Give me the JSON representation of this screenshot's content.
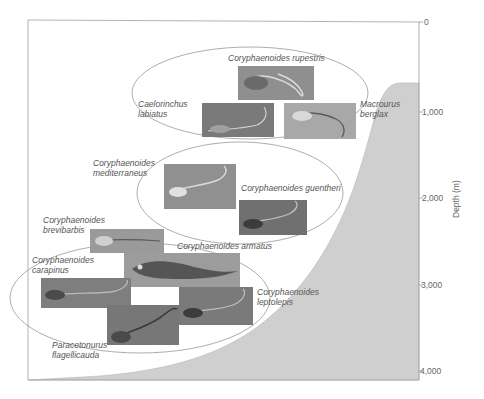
{
  "figure": {
    "axis": {
      "title": "Depth (m)",
      "ticks": [
        {
          "label": "0",
          "y": 22
        },
        {
          "label": "1,000",
          "y": 112
        },
        {
          "label": "2,000",
          "y": 198
        },
        {
          "label": "3,000",
          "y": 285
        },
        {
          "label": "4,000",
          "y": 371
        }
      ]
    },
    "colors": {
      "seafloor": "#cfcfcf",
      "frame": "#9a9a9a",
      "ellipse": "#8a8a8a",
      "label": "#555555",
      "photo_bg": "#8c8c8c"
    },
    "groups": [
      {
        "name": "shallow-group",
        "species": [
          {
            "line1": "Coryphaenoides rupestris",
            "line2": ""
          },
          {
            "line1": "Caelorinchus",
            "line2": "labiatus"
          },
          {
            "line1": "Macrourus",
            "line2": "berglax"
          }
        ]
      },
      {
        "name": "mid-group",
        "species": [
          {
            "line1": "Coryphaenoides",
            "line2": "mediterraneus"
          },
          {
            "line1": "Coryphaenoides guentheri",
            "line2": ""
          }
        ]
      },
      {
        "name": "deep-group",
        "species": [
          {
            "line1": "Coryphaenoides",
            "line2": "brevibarbis"
          },
          {
            "line1": "Coryphaenoides armatus",
            "line2": ""
          },
          {
            "line1": "Coryphaenoides",
            "line2": "carapinus"
          },
          {
            "line1": "Coryphaenoides",
            "line2": "leptolepis"
          },
          {
            "line1": "Paracetonurus",
            "line2": "flagellicauda"
          }
        ]
      }
    ]
  }
}
